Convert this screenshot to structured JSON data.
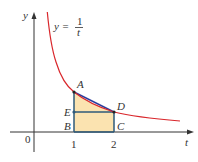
{
  "figure": {
    "equation": {
      "lhs": "y =",
      "numerator": "1",
      "denominator": "t"
    },
    "axes": {
      "x_label": "t",
      "y_label": "y",
      "origin_label": "0"
    },
    "ticks": [
      {
        "label": "1",
        "t": 1
      },
      {
        "label": "2",
        "t": 2
      }
    ],
    "points": {
      "A": "A",
      "B": "B",
      "C": "C",
      "D": "D",
      "E": "E"
    },
    "colors": {
      "curve": "#d9262b",
      "chord": "#2b3f9e",
      "rect_edge": "#2e5a7a",
      "fill": "#fbe3b0",
      "axis": "#333333"
    }
  }
}
